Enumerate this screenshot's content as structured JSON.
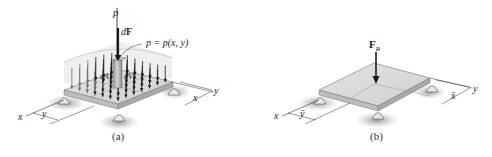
{
  "figure_a": {
    "caption": "(a)",
    "pressure_label": "p",
    "force_label": "dF",
    "force_label_d": "d",
    "force_label_F": "F",
    "distribution_label": "p = p(x, y)",
    "area_label": "dA",
    "volume_label": "dV",
    "axis_x": "x",
    "axis_y": "y",
    "dim_y": "y",
    "dim_x": "x"
  },
  "figure_b": {
    "caption": "(b)",
    "resultant_label_F": "F",
    "resultant_label_sub": "R",
    "axis_x": "x",
    "axis_y": "y",
    "dim_y": "ȳ",
    "dim_x": "x̄"
  },
  "colors": {
    "plate_top": "#d9d9d9",
    "plate_side": "#b8b8b8",
    "arrow": "#1a1a1a",
    "shadow": "#9a9a9a",
    "load_region": "#e6e6e6"
  }
}
